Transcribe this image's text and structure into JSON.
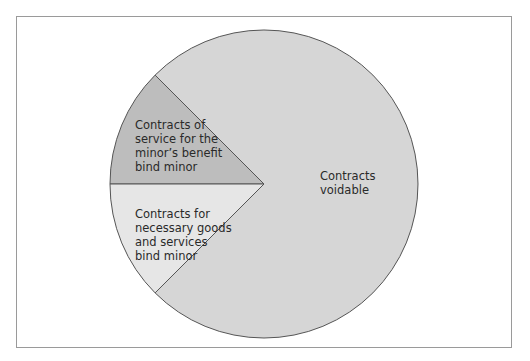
{
  "chart_data": {
    "type": "pie",
    "title": "",
    "start_angle_deg": 180,
    "direction": "clockwise",
    "slices": [
      {
        "label": [
          "Contracts of",
          "service for the",
          "minor’s benefit",
          "bind minor"
        ],
        "value": 12.5,
        "color": "#bdbdbd"
      },
      {
        "label": [
          "Contracts",
          "voidable"
        ],
        "value": 75,
        "color": "#d6d6d6"
      },
      {
        "label": [
          "Contracts for",
          "necessary goods",
          "and services",
          "bind minor"
        ],
        "value": 12.5,
        "color": "#e6e6e6"
      }
    ],
    "edge_color": "#555555"
  }
}
